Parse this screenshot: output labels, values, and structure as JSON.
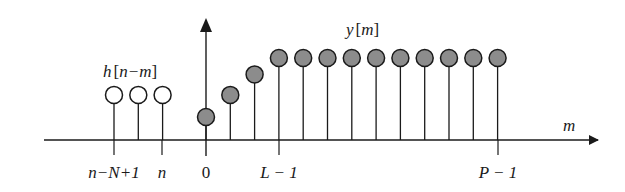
{
  "diagram": {
    "axis_label": "m",
    "h_label": {
      "func": "h",
      "open": "[",
      "arg": "n−m",
      "close": "]"
    },
    "y_label": {
      "func": "y",
      "open": "[",
      "arg": "m",
      "close": "]"
    },
    "tick_labels": {
      "n_minus_N_plus_1": "n−N+1",
      "n": "n",
      "zero": "0",
      "L_minus_1": "L − 1",
      "P_minus_1": "P − 1"
    },
    "h_samples": {
      "count": 3,
      "style": "open",
      "relative_height": 0.55
    },
    "y_samples": {
      "style": "filled",
      "fill_color": "#8c8c8c",
      "relative_heights": [
        0.28,
        0.55,
        0.8,
        1,
        1,
        1,
        1,
        1,
        1,
        1,
        1,
        1,
        1
      ]
    }
  }
}
